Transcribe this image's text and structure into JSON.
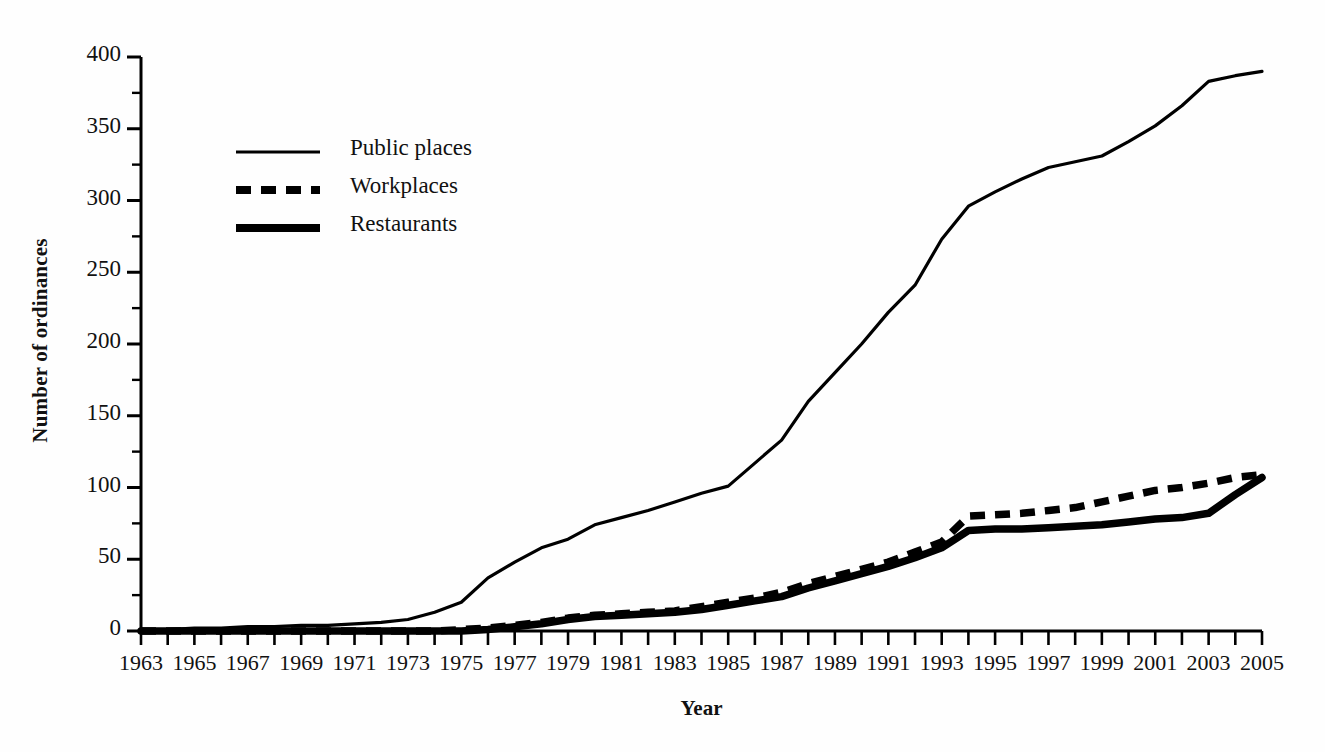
{
  "chart_data": {
    "type": "line",
    "title": "",
    "xlabel": "Year",
    "ylabel": "Number of ordinances",
    "xlim": [
      1963,
      2005
    ],
    "ylim": [
      0,
      400
    ],
    "ytick_labels": [
      "0",
      "50",
      "100",
      "150",
      "200",
      "250",
      "300",
      "350",
      "400"
    ],
    "ytick_values": [
      0,
      50,
      100,
      150,
      200,
      250,
      300,
      350,
      400
    ],
    "yminor_step": 25,
    "xtick_labels": [
      "1963",
      "1965",
      "1967",
      "1969",
      "1971",
      "1973",
      "1975",
      "1977",
      "1979",
      "1981",
      "1983",
      "1985",
      "1987",
      "1989",
      "1991",
      "1993",
      "1995",
      "1997",
      "1999",
      "2001",
      "2003",
      "2005"
    ],
    "xtick_values": [
      1963,
      1965,
      1967,
      1969,
      1971,
      1973,
      1975,
      1977,
      1979,
      1981,
      1983,
      1985,
      1987,
      1989,
      1991,
      1993,
      1995,
      1997,
      1999,
      2001,
      2003,
      2005
    ],
    "xminor_step": 1,
    "grid": false,
    "legend_position": "upper left",
    "x": [
      1963,
      1964,
      1965,
      1966,
      1967,
      1968,
      1969,
      1970,
      1971,
      1972,
      1973,
      1974,
      1975,
      1976,
      1977,
      1978,
      1979,
      1980,
      1981,
      1982,
      1983,
      1984,
      1985,
      1986,
      1987,
      1988,
      1989,
      1990,
      1991,
      1992,
      1993,
      1994,
      1995,
      1996,
      1997,
      1998,
      1999,
      2000,
      2001,
      2002,
      2003,
      2004,
      2005
    ],
    "series": [
      {
        "name": "Public places",
        "style": "thin-solid",
        "color": "#000000",
        "values": [
          1,
          1,
          2,
          2,
          3,
          3,
          4,
          4,
          5,
          6,
          8,
          13,
          20,
          37,
          48,
          58,
          64,
          74,
          79,
          84,
          90,
          96,
          101,
          117,
          133,
          160,
          180,
          200,
          222,
          241,
          273,
          296,
          306,
          315,
          323,
          327,
          331,
          341,
          352,
          366,
          383,
          387,
          390
        ]
      },
      {
        "name": "Workplaces",
        "style": "thick-dashed",
        "color": "#000000",
        "values": [
          0,
          0,
          0,
          0,
          0,
          0,
          0,
          0,
          0,
          0,
          0,
          0,
          1,
          2,
          4,
          6,
          9,
          11,
          12,
          13,
          14,
          17,
          20,
          23,
          27,
          33,
          38,
          43,
          48,
          55,
          62,
          80,
          81,
          82,
          84,
          86,
          90,
          94,
          98,
          100,
          103,
          107,
          109
        ]
      },
      {
        "name": "Restaurants",
        "style": "thick-solid",
        "color": "#000000",
        "values": [
          0,
          0,
          0,
          0,
          0,
          0,
          0,
          0,
          0,
          0,
          0,
          0,
          0,
          1,
          3,
          5,
          8,
          10,
          11,
          12,
          13,
          15,
          18,
          21,
          24,
          30,
          35,
          40,
          45,
          51,
          58,
          70,
          71,
          71,
          72,
          73,
          74,
          76,
          78,
          79,
          82,
          95,
          107
        ]
      }
    ]
  },
  "legend": {
    "items": [
      {
        "label": "Public places",
        "style": "thin-solid"
      },
      {
        "label": "Workplaces",
        "style": "thick-dashed"
      },
      {
        "label": "Restaurants",
        "style": "thick-solid"
      }
    ]
  }
}
